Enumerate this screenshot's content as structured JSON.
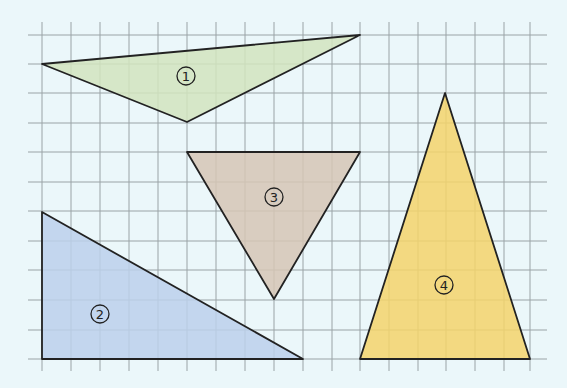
{
  "figure": {
    "background": "#ebf7fa",
    "grid": {
      "color": "#9aa3a6",
      "x_lines": [
        42,
        71,
        100,
        129,
        158,
        187,
        216,
        245,
        274,
        303,
        332,
        360,
        389,
        418,
        446,
        475,
        504,
        530
      ],
      "y_lines": [
        35,
        64,
        93,
        123,
        152,
        182,
        211,
        241,
        270,
        300,
        330,
        359
      ],
      "x_extent": [
        28,
        547
      ],
      "y_extent": [
        22,
        371
      ]
    },
    "shapes": [
      {
        "id": 1,
        "label": "1",
        "name": "triangle-1",
        "fill": "#d2e4be",
        "points": [
          [
            42,
            64
          ],
          [
            360,
            35
          ],
          [
            187,
            122
          ]
        ],
        "label_pos": [
          186,
          76
        ]
      },
      {
        "id": 2,
        "label": "2",
        "name": "triangle-2",
        "fill": "#bcd0eb",
        "points": [
          [
            42,
            212
          ],
          [
            42,
            359
          ],
          [
            303,
            359
          ]
        ],
        "label_pos": [
          100,
          314
        ]
      },
      {
        "id": 3,
        "label": "3",
        "name": "triangle-3",
        "fill": "#d6c6b5",
        "points": [
          [
            187,
            152
          ],
          [
            360,
            152
          ],
          [
            274,
            299
          ]
        ],
        "label_pos": [
          274,
          197
        ]
      },
      {
        "id": 4,
        "label": "4",
        "name": "triangle-4",
        "fill": "#f4d36b",
        "points": [
          [
            445,
            93
          ],
          [
            360,
            359
          ],
          [
            530,
            359
          ]
        ],
        "label_pos": [
          444,
          285
        ]
      }
    ],
    "stroke": "#222222"
  }
}
